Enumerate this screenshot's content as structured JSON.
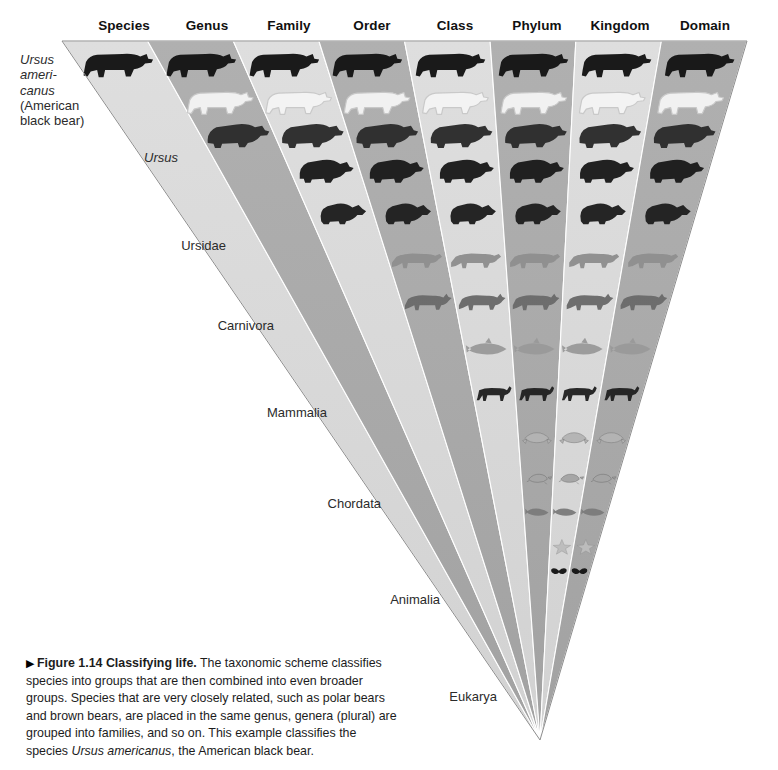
{
  "figure": {
    "marker": "▶",
    "number": "Figure 1.14",
    "title": "Classifying life.",
    "body_part1": " The taxonomic scheme classifies species into groups that are then combined into even broader groups. Species that are very closely related, such as polar bears and brown bears, are placed in the same genus, genera (plural) are grouped into families, and so on. This example classifies the species ",
    "species_italic": "Ursus americanus",
    "body_part2": ", the American black bear."
  },
  "ranks": [
    {
      "label": "Species",
      "x": 124
    },
    {
      "label": "Genus",
      "x": 207
    },
    {
      "label": "Family",
      "x": 289
    },
    {
      "label": "Order",
      "x": 372
    },
    {
      "label": "Class",
      "x": 455
    },
    {
      "label": "Phylum",
      "x": 537
    },
    {
      "label": "Kingdom",
      "x": 620
    },
    {
      "label": "Domain",
      "x": 705
    }
  ],
  "taxa": [
    {
      "name": "Ursus americanus",
      "lines": [
        "Ursus",
        "ameri-",
        "canus",
        "(American",
        "black bear)"
      ],
      "italic_lines": 3,
      "x": 20,
      "y": 52,
      "align": "left"
    },
    {
      "name": "Ursus",
      "lines": [
        "Ursus"
      ],
      "italic_lines": 1,
      "x": 178,
      "y": 150,
      "align": "right"
    },
    {
      "name": "Ursidae",
      "lines": [
        "Ursidae"
      ],
      "italic_lines": 0,
      "x": 226,
      "y": 238,
      "align": "right"
    },
    {
      "name": "Carnivora",
      "lines": [
        "Carnivora"
      ],
      "italic_lines": 0,
      "x": 274,
      "y": 318,
      "align": "right"
    },
    {
      "name": "Mammalia",
      "lines": [
        "Mammalia"
      ],
      "italic_lines": 0,
      "x": 327,
      "y": 405,
      "align": "right"
    },
    {
      "name": "Chordata",
      "lines": [
        "Chordata"
      ],
      "italic_lines": 0,
      "x": 381,
      "y": 496,
      "align": "right"
    },
    {
      "name": "Animalia",
      "lines": [
        "Animalia"
      ],
      "italic_lines": 0,
      "x": 440,
      "y": 592,
      "align": "right"
    },
    {
      "name": "Eukarya",
      "lines": [
        "Eukarya"
      ],
      "italic_lines": 0,
      "x": 497,
      "y": 689,
      "align": "right"
    }
  ],
  "colors": {
    "band_light": "#d9d9d9",
    "band_dark": "#a9a9a9",
    "band_edge": "#ffffff",
    "wedge_outline": "#8a8a8a",
    "text": "#1c1c1c"
  },
  "wedge": {
    "apex_x": 540,
    "apex_y": 740,
    "top_y": 41,
    "top_left_x": 62,
    "top_right_x": 747,
    "band_count": 8,
    "note": "Nested wedge: each rank band is wider, bands alternate light/dark gray, left staircase descends to the apex."
  },
  "organisms": {
    "species_column": [
      "black bear"
    ],
    "genus_column": [
      "black bear",
      "polar bear",
      "brown bear"
    ],
    "family_column": [
      "black bear",
      "polar bear",
      "brown bear",
      "giant panda",
      "raccoon"
    ],
    "order_column": [
      "black bear",
      "polar bear",
      "brown bear",
      "giant panda",
      "raccoon",
      "leopard",
      "wolf"
    ],
    "class_column": [
      "black bear",
      "polar bear",
      "brown bear",
      "giant panda",
      "raccoon",
      "leopard",
      "wolf",
      "dolphin",
      "zebra"
    ],
    "phylum_column": [
      "black bear",
      "polar bear",
      "brown bear",
      "giant panda",
      "raccoon",
      "leopard",
      "wolf",
      "dolphin",
      "zebra",
      "frog",
      "turtle",
      "fish"
    ],
    "kingdom_column": [
      "black bear",
      "polar bear",
      "brown bear",
      "giant panda",
      "raccoon",
      "leopard",
      "wolf",
      "dolphin",
      "zebra",
      "frog",
      "turtle",
      "fish",
      "sea star",
      "butterfly",
      "coral"
    ],
    "domain_column": [
      "black bear",
      "polar bear",
      "brown bear",
      "giant panda",
      "raccoon",
      "leopard",
      "wolf",
      "dolphin",
      "zebra",
      "frog",
      "turtle",
      "fish",
      "sea star",
      "butterfly",
      "coral",
      "orchid",
      "mushroom",
      "amoeba"
    ]
  }
}
